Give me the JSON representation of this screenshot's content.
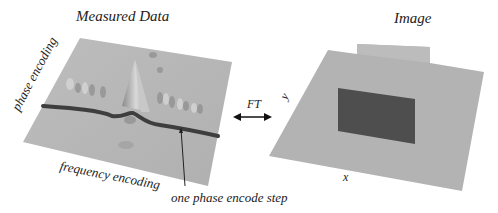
{
  "figure": {
    "left_panel": {
      "title": "Measured Data",
      "axis_labels": {
        "vertical": "phase encoding",
        "horizontal": "frequency encoding"
      },
      "annotation": "one phase encode step",
      "surface_color": "#b8b8b8",
      "line_color": "#3e3e3e"
    },
    "transform": {
      "label": "FT",
      "arrow": "double-headed-arrow"
    },
    "right_panel": {
      "title": "Image",
      "axis_labels": {
        "x": "x",
        "y": "y"
      },
      "surface_color": "#b3b3b3",
      "object_color": "#4e4e4e"
    }
  }
}
